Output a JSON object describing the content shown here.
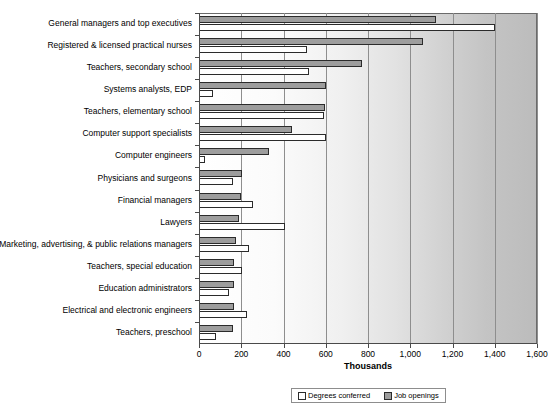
{
  "chart_data": {
    "type": "bar",
    "orientation": "horizontal",
    "title": "",
    "xlabel": "Thousands",
    "ylabel": "",
    "xlim": [
      0,
      1600
    ],
    "xticks": [
      0,
      200,
      400,
      600,
      800,
      1000,
      1200,
      1400,
      1600
    ],
    "xtick_labels": [
      "0",
      "200",
      "400",
      "600",
      "800",
      "1,000",
      "1,200",
      "1,400",
      "1,600"
    ],
    "grid": true,
    "legend_position": "bottom",
    "categories": [
      "General managers and top executives",
      "Registered & licensed practical nurses",
      "Teachers, secondary school",
      "Systems analysts, EDP",
      "Teachers, elementary school",
      "Computer support specialists",
      "Computer engineers",
      "Physicians and surgeons",
      "Financial managers",
      "Lawyers",
      "Marketing, advertising, & public relations managers",
      "Teachers, special education",
      "Education administrators",
      "Electrical and electronic engineers",
      "Teachers, preschool"
    ],
    "series": [
      {
        "name": "Job openings",
        "color": "#9d9d9d",
        "values": [
          1120,
          1060,
          770,
          600,
          595,
          440,
          330,
          205,
          200,
          190,
          175,
          168,
          165,
          165,
          160
        ]
      },
      {
        "name": "Degrees conferred",
        "color": "#ffffff",
        "values": [
          1400,
          510,
          520,
          65,
          590,
          600,
          30,
          160,
          255,
          405,
          235,
          205,
          140,
          225,
          80
        ]
      }
    ]
  },
  "legend": {
    "items": [
      {
        "label": "Degrees conferred",
        "swatch": "white-square"
      },
      {
        "label": "Job openings",
        "swatch": "gray-square"
      }
    ]
  },
  "axis": {
    "x_title": "Thousands"
  }
}
